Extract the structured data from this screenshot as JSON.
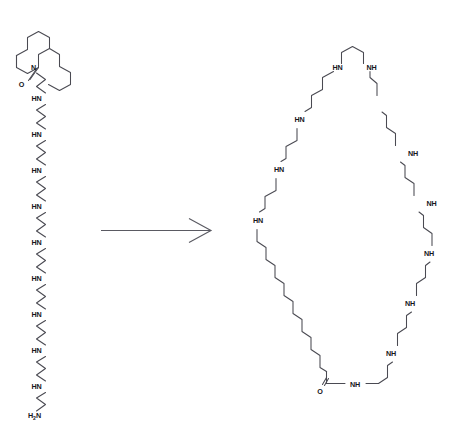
{
  "figure": {
    "type": "chemical-reaction-scheme",
    "background_color": "#ffffff",
    "bond_color": "#4a4a52",
    "label_color": "#16161a",
    "width": 457,
    "height": 423
  },
  "reactant": {
    "name": "linear-polyamine-macrolactam",
    "description": "Macrocyclic lactam bearing a pendant linear polyamine chain terminating in a primary amine",
    "ring": {
      "name": "macrolactam-ring",
      "label_nitrogen": "N",
      "label_oxygen": "O"
    },
    "chain_labels": [
      "HN",
      "HN",
      "HN",
      "HN",
      "HN",
      "HN",
      "HN",
      "HN",
      "HN"
    ],
    "terminal_label": "H",
    "terminal_sub": "2",
    "terminal_label_tail": "N"
  },
  "arrow": {
    "name": "reaction-arrow",
    "direction": "right",
    "label": ""
  },
  "product": {
    "name": "polyaza-macrocycle",
    "description": "Large polyaza macrocycle closed through an amide bond, containing eleven secondary amine NH groups and one long polymethylene segment",
    "top_labels": [
      "HN",
      "NH"
    ],
    "left_labels": [
      "HN",
      "HN",
      "HN"
    ],
    "right_labels": [
      "NH",
      "NH",
      "NH",
      "NH"
    ],
    "amide_labels": {
      "oxygen": "O",
      "nitrogen": "NH"
    }
  }
}
